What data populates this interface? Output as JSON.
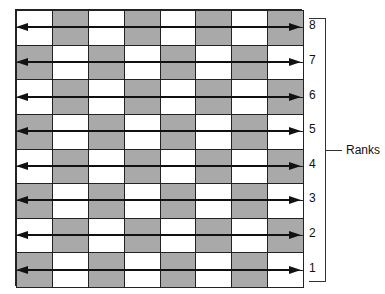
{
  "diagram": {
    "type": "chessboard-ranks",
    "columns": 8,
    "ranks": [
      {
        "label": "8",
        "first_color": "white"
      },
      {
        "label": "7",
        "first_color": "gray"
      },
      {
        "label": "6",
        "first_color": "white"
      },
      {
        "label": "5",
        "first_color": "gray"
      },
      {
        "label": "4",
        "first_color": "white"
      },
      {
        "label": "3",
        "first_color": "gray"
      },
      {
        "label": "2",
        "first_color": "white"
      },
      {
        "label": "1",
        "first_color": "gray"
      }
    ],
    "bracket_label": "Ranks",
    "arrow": "double-headed horizontal arrow across each rank",
    "colors": {
      "dark": "#a9a9a9",
      "light": "#ffffff",
      "line": "#222222"
    }
  }
}
